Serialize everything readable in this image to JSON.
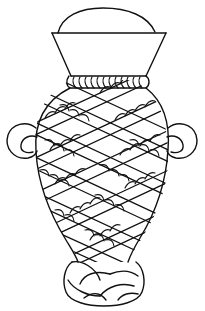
{
  "image": {
    "subject": "Line drawing of a two-handled vase with rope-wrapped lattice decoration",
    "background_color": "#ffffff",
    "line_color": "#111111",
    "parts": [
      {
        "name": "dome-lid",
        "label": "Dome lid"
      },
      {
        "name": "flared-neck",
        "label": "Flared neck"
      },
      {
        "name": "rope-collar",
        "label": "Rope collar"
      },
      {
        "name": "left-handle",
        "label": "Left ring handle"
      },
      {
        "name": "right-handle",
        "label": "Right ring handle"
      },
      {
        "name": "body-lattice",
        "label": "Diagonal rope lattice body"
      },
      {
        "name": "twisted-foot",
        "label": "Twisted rope foot"
      }
    ]
  }
}
